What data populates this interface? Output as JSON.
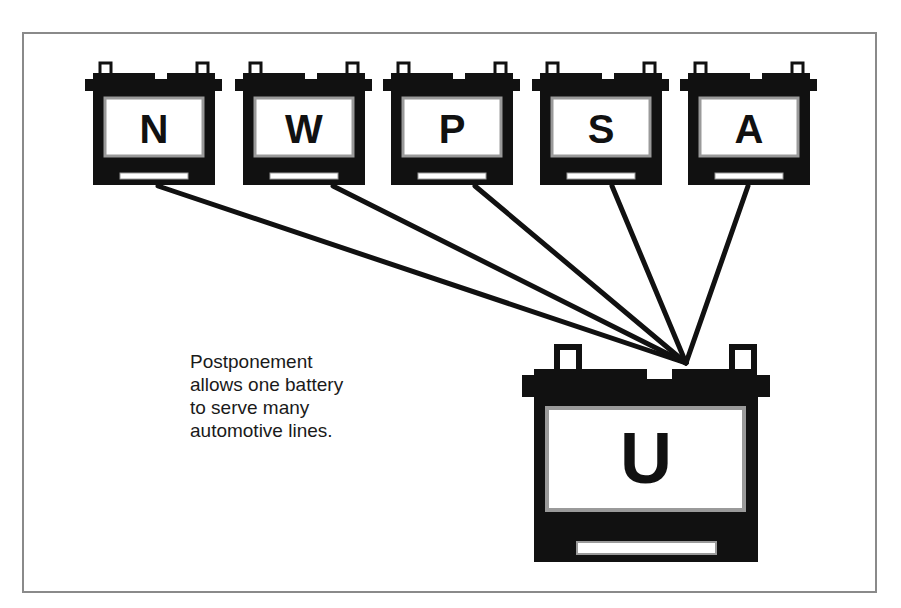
{
  "diagram": {
    "caption_lines": [
      "Postponement",
      "allows one battery",
      "to serve many",
      "automotive lines."
    ],
    "top_batteries": [
      {
        "label": "N"
      },
      {
        "label": "W"
      },
      {
        "label": "P"
      },
      {
        "label": "S"
      },
      {
        "label": "A"
      }
    ],
    "bottom_battery": {
      "label": "U"
    },
    "colors": {
      "battery": "#111111",
      "label_border": "#9a9a9a",
      "frame": "#8a8a8a",
      "background": "#ffffff"
    }
  }
}
